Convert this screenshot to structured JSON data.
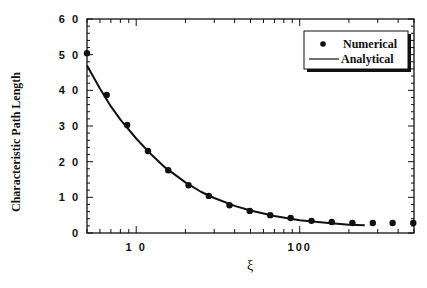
{
  "chart_data": {
    "type": "scatter",
    "title": "",
    "xlabel": "ξ",
    "ylabel": "Characteristic Path Length",
    "xscale": "log",
    "xlim": [
      5,
      500
    ],
    "ylim": [
      0,
      60
    ],
    "x_ticks": [
      {
        "value": 10,
        "label": "1 0"
      },
      {
        "value": 100,
        "label": "100"
      }
    ],
    "y_ticks": [
      {
        "value": 0,
        "label": "0"
      },
      {
        "value": 10,
        "label": "1 0"
      },
      {
        "value": 20,
        "label": "2 0"
      },
      {
        "value": 30,
        "label": "3 0"
      },
      {
        "value": 40,
        "label": "4 0"
      },
      {
        "value": 50,
        "label": "5 0"
      },
      {
        "value": 60,
        "label": "6 0"
      }
    ],
    "grid": false,
    "legend_position": "upper right",
    "series": [
      {
        "name": "Numerical",
        "style": "markers",
        "x": [
          5,
          6.6,
          8.8,
          11.8,
          15.7,
          20.9,
          27.8,
          37.2,
          49.5,
          66,
          88,
          118,
          157,
          210,
          280,
          370,
          495
        ],
        "y": [
          50.4,
          38.7,
          30.3,
          23.0,
          17.6,
          13.4,
          10.4,
          7.8,
          6.2,
          5.0,
          4.2,
          3.4,
          3.1,
          2.8,
          2.8,
          2.8,
          2.8
        ]
      },
      {
        "name": "Analytical",
        "style": "line",
        "x": [
          5,
          6,
          7,
          8,
          10,
          12,
          15,
          20,
          25,
          30,
          40,
          50,
          70,
          100,
          150,
          200,
          250
        ],
        "y": [
          47,
          40.5,
          35.5,
          31.8,
          26.5,
          22.6,
          18.4,
          14.2,
          11.5,
          9.8,
          7.6,
          6.3,
          4.8,
          3.6,
          2.8,
          2.3,
          2.2
        ]
      }
    ]
  },
  "legend": {
    "items": [
      {
        "label": "Numerical",
        "symbol": "dot"
      },
      {
        "label": "Analytical",
        "symbol": "line"
      }
    ]
  },
  "colors": {
    "ink": "#111111",
    "background": "#ffffff"
  }
}
